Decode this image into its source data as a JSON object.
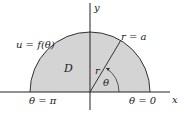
{
  "diagram": {
    "region_label": "D",
    "curve_label": "u = f(θ)",
    "radius_label": "r = a",
    "ray_label": "r",
    "angle_label": "θ",
    "theta_pi_label": "θ = π",
    "theta_zero_label": "θ = 0",
    "x_axis_label": "x",
    "y_axis_label": "y",
    "colors": {
      "fill": "#d4d4d4",
      "stroke": "#333333",
      "axis": "#222222"
    }
  }
}
